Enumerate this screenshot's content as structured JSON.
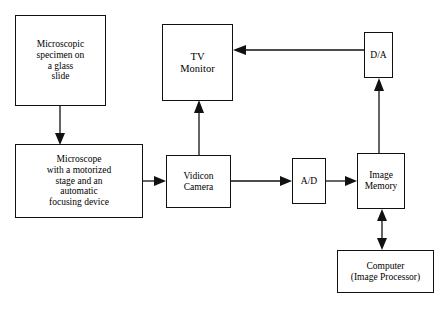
{
  "diagram": {
    "background_color": "#ffffff",
    "line_color": "#111111",
    "nodes": {
      "specimen": {
        "label": "Microscopic\nspecimen on\na glass\nslide"
      },
      "microscope": {
        "label": "Microscope\nwith a motorized\nstage and an\nautomatic\nfocusing device"
      },
      "tv_monitor": {
        "label": "TV\nMonitor"
      },
      "vidicon": {
        "label": "Vidicon\nCamera"
      },
      "ad": {
        "label": "A/D"
      },
      "memory": {
        "label": "Image\nMemory"
      },
      "da": {
        "label": "D/A"
      },
      "computer": {
        "label": "Computer\n(Image Processor)"
      }
    },
    "connections": [
      {
        "name": "specimen-to-microscope",
        "from": "specimen",
        "to": "microscope",
        "direction": "down",
        "arrowheads": 1
      },
      {
        "name": "microscope-to-vidicon",
        "from": "microscope",
        "to": "vidicon",
        "direction": "right",
        "arrowheads": 1
      },
      {
        "name": "vidicon-to-tv-monitor",
        "from": "vidicon",
        "to": "tv_monitor",
        "direction": "up",
        "arrowheads": 1
      },
      {
        "name": "vidicon-to-ad",
        "from": "vidicon",
        "to": "ad",
        "direction": "right",
        "arrowheads": 1
      },
      {
        "name": "ad-to-memory",
        "from": "ad",
        "to": "memory",
        "direction": "right",
        "arrowheads": 1
      },
      {
        "name": "memory-to-da",
        "from": "memory",
        "to": "da",
        "direction": "up",
        "arrowheads": 1
      },
      {
        "name": "da-to-tv-monitor",
        "from": "da",
        "to": "tv_monitor",
        "direction": "left",
        "arrowheads": 1
      },
      {
        "name": "memory-computer-bidirectional",
        "from": "memory",
        "to": "computer",
        "direction": "both",
        "arrowheads": 2
      }
    ]
  }
}
